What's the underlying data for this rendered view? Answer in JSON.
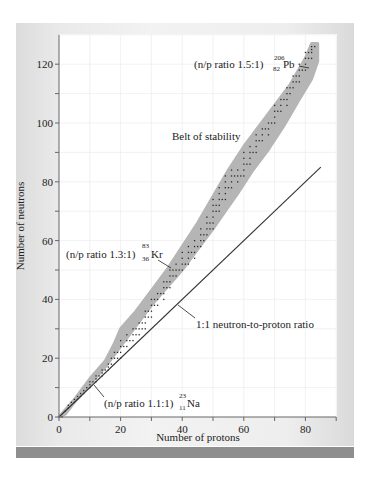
{
  "chart_data": {
    "type": "scatter",
    "title": "",
    "xlabel": "Number of protons",
    "ylabel": "Number of neutrons",
    "xlim": [
      0,
      90
    ],
    "ylim": [
      0,
      130
    ],
    "grid": true,
    "x_ticks": [
      0,
      20,
      40,
      60,
      80
    ],
    "x_minor_ticks": [
      10,
      30,
      50,
      70,
      90
    ],
    "y_ticks": [
      0,
      20,
      40,
      60,
      80,
      100,
      120
    ],
    "y_minor_ticks": [
      10,
      30,
      50,
      70,
      90,
      110
    ],
    "series": [
      {
        "name": "1:1 neutron-to-proton ratio",
        "kind": "line",
        "points": [
          [
            0,
            0
          ],
          [
            85,
            85
          ]
        ]
      },
      {
        "name": "Belt of stability",
        "kind": "band",
        "upper": [
          [
            0,
            0
          ],
          [
            5,
            6
          ],
          [
            10,
            13
          ],
          [
            15,
            19
          ],
          [
            18,
            25
          ],
          [
            20,
            30
          ],
          [
            25,
            36
          ],
          [
            30,
            43
          ],
          [
            35,
            50
          ],
          [
            40,
            58
          ],
          [
            45,
            66
          ],
          [
            50,
            75
          ],
          [
            55,
            84
          ],
          [
            60,
            92
          ],
          [
            65,
            99
          ],
          [
            70,
            106
          ],
          [
            75,
            113
          ],
          [
            80,
            122
          ],
          [
            82,
            127
          ],
          [
            84,
            127
          ]
        ],
        "lower": [
          [
            84,
            127
          ],
          [
            84,
            121
          ],
          [
            82,
            115
          ],
          [
            78,
            108
          ],
          [
            73,
            99
          ],
          [
            68,
            91
          ],
          [
            63,
            84
          ],
          [
            58,
            76
          ],
          [
            54,
            70
          ],
          [
            50,
            64
          ],
          [
            45,
            57
          ],
          [
            40,
            50
          ],
          [
            35,
            44
          ],
          [
            30,
            38
          ],
          [
            25,
            31
          ],
          [
            20,
            24
          ],
          [
            15,
            17
          ],
          [
            10,
            11
          ],
          [
            5,
            5
          ],
          [
            2,
            1
          ],
          [
            0,
            0
          ]
        ]
      },
      {
        "name": "Stable nuclides",
        "kind": "scatter",
        "points": [
          [
            1,
            0
          ],
          [
            2,
            2
          ],
          [
            3,
            3
          ],
          [
            3,
            4
          ],
          [
            4,
            5
          ],
          [
            5,
            5
          ],
          [
            5,
            6
          ],
          [
            6,
            6
          ],
          [
            6,
            7
          ],
          [
            7,
            7
          ],
          [
            7,
            8
          ],
          [
            8,
            8
          ],
          [
            8,
            9
          ],
          [
            9,
            10
          ],
          [
            10,
            10
          ],
          [
            10,
            11
          ],
          [
            10,
            12
          ],
          [
            11,
            12
          ],
          [
            12,
            12
          ],
          [
            12,
            13
          ],
          [
            12,
            14
          ],
          [
            13,
            14
          ],
          [
            14,
            14
          ],
          [
            14,
            15
          ],
          [
            14,
            16
          ],
          [
            15,
            16
          ],
          [
            16,
            16
          ],
          [
            16,
            17
          ],
          [
            16,
            18
          ],
          [
            17,
            18
          ],
          [
            17,
            20
          ],
          [
            18,
            20
          ],
          [
            18,
            22
          ],
          [
            19,
            20
          ],
          [
            19,
            22
          ],
          [
            20,
            20
          ],
          [
            20,
            22
          ],
          [
            20,
            24
          ],
          [
            20,
            26
          ],
          [
            21,
            24
          ],
          [
            22,
            24
          ],
          [
            22,
            26
          ],
          [
            22,
            28
          ],
          [
            23,
            26
          ],
          [
            24,
            26
          ],
          [
            24,
            28
          ],
          [
            24,
            30
          ],
          [
            25,
            28
          ],
          [
            25,
            30
          ],
          [
            26,
            28
          ],
          [
            26,
            30
          ],
          [
            26,
            32
          ],
          [
            27,
            30
          ],
          [
            27,
            32
          ],
          [
            28,
            30
          ],
          [
            28,
            32
          ],
          [
            28,
            34
          ],
          [
            28,
            36
          ],
          [
            29,
            34
          ],
          [
            29,
            36
          ],
          [
            30,
            34
          ],
          [
            30,
            36
          ],
          [
            30,
            38
          ],
          [
            30,
            40
          ],
          [
            31,
            38
          ],
          [
            31,
            40
          ],
          [
            32,
            38
          ],
          [
            32,
            40
          ],
          [
            32,
            42
          ],
          [
            33,
            42
          ],
          [
            34,
            40
          ],
          [
            34,
            42
          ],
          [
            34,
            44
          ],
          [
            34,
            46
          ],
          [
            35,
            44
          ],
          [
            35,
            46
          ],
          [
            36,
            44
          ],
          [
            36,
            46
          ],
          [
            36,
            48
          ],
          [
            36,
            50
          ],
          [
            37,
            48
          ],
          [
            37,
            50
          ],
          [
            38,
            48
          ],
          [
            38,
            50
          ],
          [
            38,
            52
          ],
          [
            39,
            50
          ],
          [
            40,
            50
          ],
          [
            40,
            52
          ],
          [
            40,
            54
          ],
          [
            40,
            56
          ],
          [
            41,
            52
          ],
          [
            42,
            52
          ],
          [
            42,
            54
          ],
          [
            42,
            56
          ],
          [
            42,
            58
          ],
          [
            43,
            56
          ],
          [
            44,
            54
          ],
          [
            44,
            56
          ],
          [
            44,
            58
          ],
          [
            44,
            60
          ],
          [
            45,
            58
          ],
          [
            46,
            58
          ],
          [
            46,
            60
          ],
          [
            46,
            62
          ],
          [
            46,
            64
          ],
          [
            47,
            60
          ],
          [
            47,
            62
          ],
          [
            48,
            62
          ],
          [
            48,
            64
          ],
          [
            48,
            66
          ],
          [
            48,
            68
          ],
          [
            49,
            64
          ],
          [
            49,
            66
          ],
          [
            50,
            64
          ],
          [
            50,
            66
          ],
          [
            50,
            68
          ],
          [
            50,
            70
          ],
          [
            50,
            72
          ],
          [
            50,
            74
          ],
          [
            51,
            70
          ],
          [
            51,
            72
          ],
          [
            52,
            70
          ],
          [
            52,
            72
          ],
          [
            52,
            74
          ],
          [
            52,
            76
          ],
          [
            52,
            78
          ],
          [
            53,
            74
          ],
          [
            54,
            74
          ],
          [
            54,
            76
          ],
          [
            54,
            78
          ],
          [
            54,
            80
          ],
          [
            54,
            82
          ],
          [
            55,
            78
          ],
          [
            56,
            78
          ],
          [
            56,
            80
          ],
          [
            56,
            82
          ],
          [
            56,
            84
          ],
          [
            57,
            82
          ],
          [
            58,
            80
          ],
          [
            58,
            82
          ],
          [
            58,
            84
          ],
          [
            59,
            82
          ],
          [
            60,
            82
          ],
          [
            60,
            84
          ],
          [
            60,
            86
          ],
          [
            60,
            88
          ],
          [
            60,
            90
          ],
          [
            61,
            86
          ],
          [
            62,
            86
          ],
          [
            62,
            88
          ],
          [
            62,
            90
          ],
          [
            62,
            92
          ],
          [
            63,
            90
          ],
          [
            64,
            90
          ],
          [
            64,
            92
          ],
          [
            64,
            94
          ],
          [
            64,
            96
          ],
          [
            65,
            94
          ],
          [
            66,
            94
          ],
          [
            66,
            96
          ],
          [
            66,
            98
          ],
          [
            67,
            98
          ],
          [
            68,
            96
          ],
          [
            68,
            98
          ],
          [
            68,
            100
          ],
          [
            69,
            100
          ],
          [
            70,
            100
          ],
          [
            70,
            102
          ],
          [
            70,
            104
          ],
          [
            70,
            106
          ],
          [
            71,
            104
          ],
          [
            72,
            104
          ],
          [
            72,
            106
          ],
          [
            72,
            108
          ],
          [
            73,
            108
          ],
          [
            74,
            106
          ],
          [
            74,
            108
          ],
          [
            74,
            110
          ],
          [
            74,
            112
          ],
          [
            75,
            110
          ],
          [
            75,
            112
          ],
          [
            76,
            112
          ],
          [
            76,
            114
          ],
          [
            76,
            116
          ],
          [
            77,
            114
          ],
          [
            77,
            116
          ],
          [
            78,
            114
          ],
          [
            78,
            116
          ],
          [
            78,
            118
          ],
          [
            78,
            120
          ],
          [
            79,
            118
          ],
          [
            80,
            118
          ],
          [
            80,
            120
          ],
          [
            80,
            122
          ],
          [
            80,
            124
          ],
          [
            81,
            122
          ],
          [
            81,
            124
          ],
          [
            82,
            122
          ],
          [
            82,
            124
          ],
          [
            82,
            125
          ],
          [
            82,
            126
          ],
          [
            83,
            126
          ]
        ]
      }
    ],
    "annotations": [
      {
        "id": "pb",
        "prefix": "(n/p ratio 1.5:1) ",
        "mass": "206",
        "atomic": "82",
        "symbol": "Pb",
        "target": [
          82,
          124
        ]
      },
      {
        "id": "belt",
        "text": "Belt of stability"
      },
      {
        "id": "kr",
        "prefix": "(n/p ratio 1.3:1)",
        "mass": "83",
        "atomic": "36",
        "symbol": "Kr",
        "target": [
          36,
          51
        ]
      },
      {
        "id": "ratio",
        "text": "1:1 neutron-to-proton ratio",
        "target": [
          38,
          38
        ]
      },
      {
        "id": "na",
        "prefix": "(n/p ratio 1.1:1)",
        "mass": "23",
        "atomic": "11",
        "symbol": "Na",
        "target": [
          11,
          12
        ]
      }
    ],
    "colors": {
      "band": "#b5b5b5",
      "dots": "#2a2a2a",
      "line": "#333333",
      "grid": "#eeeeee",
      "axis": "#666666",
      "frame": "#e6e6e6",
      "bottom_bar": "#8e8e8e"
    }
  }
}
